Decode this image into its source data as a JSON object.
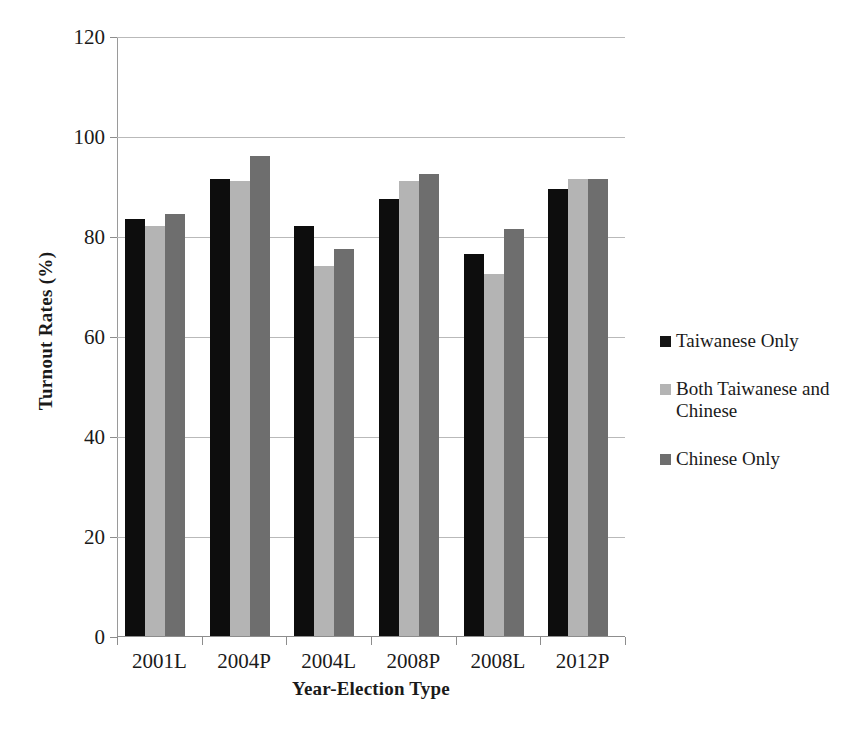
{
  "chart_data": {
    "type": "bar",
    "title": "",
    "xlabel": "Year-Election Type",
    "ylabel": "Turnout Rates (%)",
    "categories": [
      "2001L",
      "2004P",
      "2004L",
      "2008P",
      "2008L",
      "2012P"
    ],
    "series": [
      {
        "name": "Taiwanese Only",
        "color": "#0d0d0d",
        "values": [
          83.5,
          91.5,
          82.0,
          87.5,
          76.5,
          89.5
        ]
      },
      {
        "name": "Both Taiwanese and Chinese",
        "color": "#b4b4b4",
        "values": [
          82.0,
          91.0,
          74.0,
          91.0,
          72.5,
          91.5
        ]
      },
      {
        "name": "Chinese Only",
        "color": "#6e6e6e",
        "values": [
          84.5,
          96.0,
          77.5,
          92.5,
          81.5,
          91.5
        ]
      }
    ],
    "ylim": [
      0,
      120
    ],
    "yticks": [
      0,
      20,
      40,
      60,
      80,
      100,
      120
    ],
    "ytick_labels": [
      "0",
      "20",
      "40",
      "60",
      "80",
      "100",
      "120"
    ],
    "grid": true,
    "legend_position": "right"
  },
  "legend": {
    "items": [
      {
        "label": "Taiwanese Only"
      },
      {
        "label": "Both Taiwanese and Chinese"
      },
      {
        "label": "Chinese Only"
      }
    ]
  },
  "caption": {
    "text": "partially visible cut-off caption line"
  }
}
